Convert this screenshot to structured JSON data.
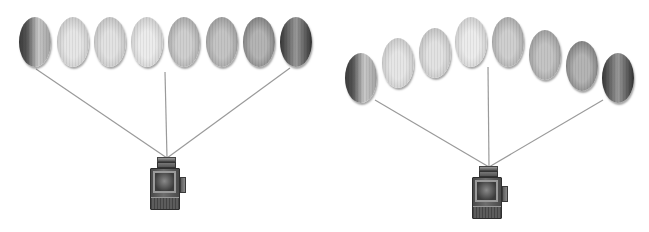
{
  "figure": {
    "line_color": "#9a9a9a",
    "panels": [
      {
        "id": "flat-row",
        "camera": {
          "x": 150,
          "y": 157,
          "apex": [
            167,
            158
          ]
        },
        "lines": [
          {
            "from": [
              36,
              69
            ],
            "to": [
              167,
              158
            ]
          },
          {
            "from": [
              165,
              72
            ],
            "to": [
              167,
              158
            ]
          },
          {
            "from": [
              290,
              68
            ],
            "to": [
              167,
              158
            ]
          }
        ],
        "eggs": [
          {
            "cx": 35,
            "cy": 42,
            "rx": 16,
            "ry": 25,
            "shade": "dark-left",
            "light": "#c8c8c8",
            "dark": "#3a3a3a"
          },
          {
            "cx": 73,
            "cy": 42,
            "rx": 16,
            "ry": 25,
            "shade": "light",
            "light": "#e6e6e6",
            "dark": "#b0b0b0"
          },
          {
            "cx": 110,
            "cy": 42,
            "rx": 16,
            "ry": 25,
            "shade": "light",
            "light": "#e2e2e2",
            "dark": "#a8a8a8"
          },
          {
            "cx": 147,
            "cy": 42,
            "rx": 16,
            "ry": 25,
            "shade": "lightest",
            "light": "#ececec",
            "dark": "#b4b4b4"
          },
          {
            "cx": 184,
            "cy": 42,
            "rx": 16,
            "ry": 25,
            "shade": "mid",
            "light": "#cfcfcf",
            "dark": "#8c8c8c"
          },
          {
            "cx": 222,
            "cy": 42,
            "rx": 16,
            "ry": 25,
            "shade": "mid",
            "light": "#c4c4c4",
            "dark": "#808080"
          },
          {
            "cx": 259,
            "cy": 42,
            "rx": 16,
            "ry": 25,
            "shade": "mid-dark",
            "light": "#b4b4b4",
            "dark": "#5c5c5c"
          },
          {
            "cx": 296,
            "cy": 42,
            "rx": 16,
            "ry": 25,
            "shade": "dark",
            "light": "#9a9a9a",
            "dark": "#333333"
          }
        ]
      },
      {
        "id": "arched-row",
        "camera": {
          "x": 472,
          "y": 166,
          "apex": [
            489,
            167
          ]
        },
        "lines": [
          {
            "from": [
              375,
              100
            ],
            "to": [
              489,
              167
            ]
          },
          {
            "from": [
              488,
              67
            ],
            "to": [
              489,
              167
            ]
          },
          {
            "from": [
              603,
              100
            ],
            "to": [
              489,
              167
            ]
          }
        ],
        "eggs": [
          {
            "cx": 361,
            "cy": 78,
            "rx": 16,
            "ry": 25,
            "shade": "dark-left",
            "light": "#c8c8c8",
            "dark": "#3a3a3a"
          },
          {
            "cx": 398,
            "cy": 63,
            "rx": 16,
            "ry": 25,
            "shade": "light",
            "light": "#e6e6e6",
            "dark": "#b0b0b0"
          },
          {
            "cx": 435,
            "cy": 53,
            "rx": 16,
            "ry": 25,
            "shade": "light",
            "light": "#e2e2e2",
            "dark": "#a8a8a8"
          },
          {
            "cx": 471,
            "cy": 42,
            "rx": 16,
            "ry": 25,
            "shade": "lightest",
            "light": "#ececec",
            "dark": "#b4b4b4"
          },
          {
            "cx": 508,
            "cy": 42,
            "rx": 16,
            "ry": 25,
            "shade": "mid",
            "light": "#cfcfcf",
            "dark": "#8c8c8c"
          },
          {
            "cx": 545,
            "cy": 55,
            "rx": 16,
            "ry": 25,
            "shade": "mid",
            "light": "#c4c4c4",
            "dark": "#808080"
          },
          {
            "cx": 582,
            "cy": 66,
            "rx": 16,
            "ry": 25,
            "shade": "mid-dark",
            "light": "#b4b4b4",
            "dark": "#5c5c5c"
          },
          {
            "cx": 618,
            "cy": 78,
            "rx": 16,
            "ry": 25,
            "shade": "dark",
            "light": "#9a9a9a",
            "dark": "#333333"
          }
        ]
      }
    ]
  }
}
